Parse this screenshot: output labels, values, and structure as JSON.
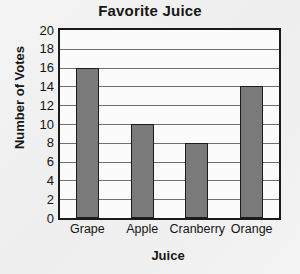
{
  "chart_data": {
    "type": "bar",
    "title": "Favorite Juice",
    "xlabel": "Juice",
    "ylabel": "Number of Votes",
    "categories": [
      "Grape",
      "Apple",
      "Cranberry",
      "Orange"
    ],
    "values": [
      16,
      10,
      8,
      14
    ],
    "ylim": [
      0,
      20
    ],
    "ytick_step": 2,
    "yticks": [
      20,
      18,
      16,
      14,
      12,
      10,
      8,
      6,
      4,
      2,
      0
    ],
    "ytick_labels": [
      "20",
      "18",
      "16",
      "14",
      "12",
      "10",
      "8",
      "6",
      "4",
      "2",
      "0"
    ],
    "grid": true,
    "grid_orientation": "horizontal",
    "legend": null,
    "legend_position": "none",
    "bar_color": "#7a7a7a",
    "bar_edge_color": "#1d1d1d",
    "axis_color": "#1b1b1b",
    "grid_color": "#6f6f6f",
    "plot_background": "#fbfbfb",
    "page_background": "#f1f1f1",
    "text_color": "#141414"
  }
}
